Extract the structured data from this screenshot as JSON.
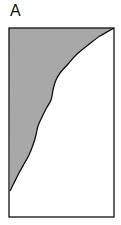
{
  "figure": {
    "panel_label": "A",
    "frame": {
      "x": 9,
      "y": 28,
      "width": 105,
      "height": 189
    },
    "fill_color": "#a8a8a8",
    "stroke_color": "#111111",
    "curve_points": [
      [
        114,
        28
      ],
      [
        100,
        36
      ],
      [
        88,
        45
      ],
      [
        77,
        54
      ],
      [
        68,
        64
      ],
      [
        60,
        73
      ],
      [
        56,
        80
      ],
      [
        53,
        90
      ],
      [
        51,
        100
      ],
      [
        46,
        109
      ],
      [
        42,
        117
      ],
      [
        38,
        126
      ],
      [
        36,
        135
      ],
      [
        33,
        145
      ],
      [
        29,
        155
      ],
      [
        24,
        164
      ],
      [
        19,
        173
      ],
      [
        14,
        183
      ],
      [
        10,
        191
      ]
    ]
  }
}
